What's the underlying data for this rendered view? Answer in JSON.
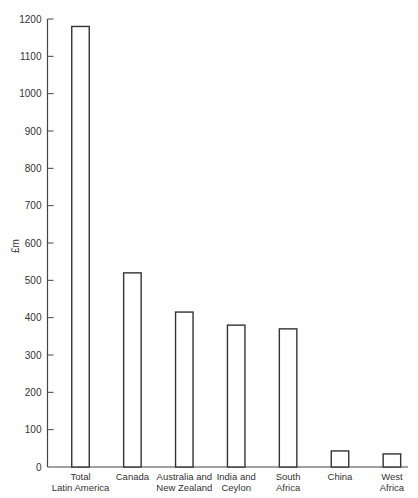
{
  "chart_data": {
    "type": "bar",
    "title": "",
    "xlabel": "",
    "ylabel": "£m",
    "ylim": [
      0,
      1200
    ],
    "yticks": [
      0,
      100,
      200,
      300,
      400,
      500,
      600,
      700,
      800,
      900,
      1000,
      1100,
      1200
    ],
    "grid": false,
    "legend": null,
    "categories": [
      [
        "Total",
        "Latin America"
      ],
      [
        "Canada"
      ],
      [
        "Australia and",
        "New Zealand"
      ],
      [
        "India and",
        "Ceylon"
      ],
      [
        "South",
        "Africa"
      ],
      [
        "China"
      ],
      [
        "West",
        "Africa"
      ]
    ],
    "category_names": [
      "Total Latin America",
      "Canada",
      "Australia and New Zealand",
      "India and Ceylon",
      "South Africa",
      "China",
      "West Africa"
    ],
    "values": [
      1180,
      520,
      415,
      380,
      370,
      43,
      35
    ],
    "bar_fill": "#ffffff",
    "bar_stroke": "#333333"
  }
}
